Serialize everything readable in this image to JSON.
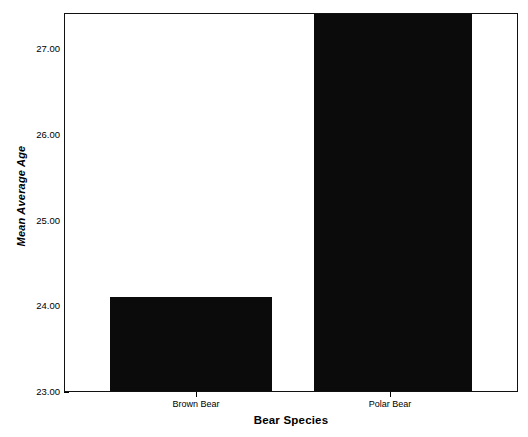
{
  "chart_data": {
    "type": "bar",
    "title": "",
    "subtitle": "",
    "xlabel": "Bear Species",
    "ylabel": "Mean Average Age",
    "categories": [
      "Brown Bear",
      "Polar Bear"
    ],
    "values": [
      24.0,
      27.0
    ],
    "ylim": [
      23.0,
      27.0
    ],
    "yticks": [
      "23.00",
      "24.00",
      "25.00",
      "26.00",
      "27.00"
    ],
    "ytick_values": [
      23.0,
      24.0,
      25.0,
      26.0,
      27.0
    ],
    "grid": false,
    "legend": false,
    "legend_position": "none",
    "bar_color": "#0b0b0b",
    "frame_color": "#111111",
    "background_color": "#ffffff"
  }
}
